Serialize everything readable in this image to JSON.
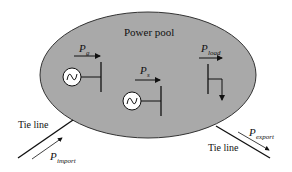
{
  "diagram": {
    "pool_label": "Power pool",
    "pool_color": "#a9a9a9",
    "generators": [
      {
        "symbol": "P",
        "subscript": "g"
      },
      {
        "symbol": "P",
        "subscript": "s"
      }
    ],
    "load": {
      "symbol": "P",
      "subscript": "load"
    },
    "tie_lines": [
      {
        "label": "Tie line",
        "flow_symbol": "P",
        "flow_subscript": "import"
      },
      {
        "label": "Tie line",
        "flow_symbol": "P",
        "flow_subscript": "export"
      }
    ]
  }
}
